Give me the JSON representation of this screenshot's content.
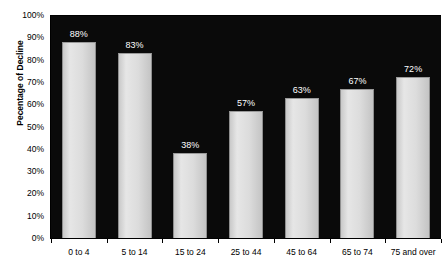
{
  "chart_data": {
    "type": "bar",
    "title": "since 1942",
    "xlabel": "",
    "ylabel": "Pecentage of Decline",
    "categories": [
      "0 to 4",
      "5 to 14",
      "15 to 24",
      "25 to 44",
      "45 to 64",
      "65 to 74",
      "75 and over"
    ],
    "values": [
      88,
      83,
      38,
      57,
      63,
      67,
      72
    ],
    "value_labels": [
      "88%",
      "83%",
      "38%",
      "57%",
      "63%",
      "67%",
      "72%"
    ],
    "ylim": [
      0,
      100
    ],
    "y_ticks": [
      0,
      10,
      20,
      30,
      40,
      50,
      60,
      70,
      80,
      90,
      100
    ],
    "y_tick_labels": [
      "0%",
      "10%",
      "20%",
      "30%",
      "40%",
      "50%",
      "60%",
      "70%",
      "80%",
      "90%",
      "100%"
    ],
    "grid": false,
    "legend": "none",
    "colors": {
      "plot_background": "#0a0a0a",
      "bar_fill": "#dcdcdc",
      "bar_edge": "#8f8f8f",
      "axis": "#000000",
      "value_label": "#ffffff",
      "page_background": "#ffffff"
    }
  }
}
